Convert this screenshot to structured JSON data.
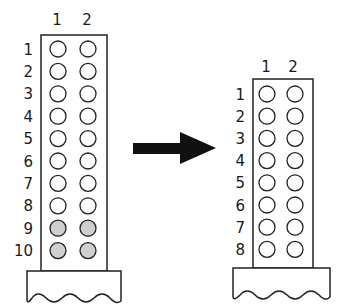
{
  "diagram": {
    "left_grid": {
      "column_labels": [
        "1",
        "2"
      ],
      "row_labels": [
        "1",
        "2",
        "3",
        "4",
        "5",
        "6",
        "7",
        "8",
        "9",
        "10"
      ],
      "shaded_rows": [
        "9",
        "10"
      ],
      "shade_color": "#cfcfcf"
    },
    "right_grid": {
      "column_labels": [
        "1",
        "2"
      ],
      "row_labels": [
        "1",
        "2",
        "3",
        "4",
        "5",
        "6",
        "7",
        "8"
      ],
      "shaded_rows": []
    },
    "arrow": {
      "direction": "right",
      "color": "#111111"
    }
  }
}
